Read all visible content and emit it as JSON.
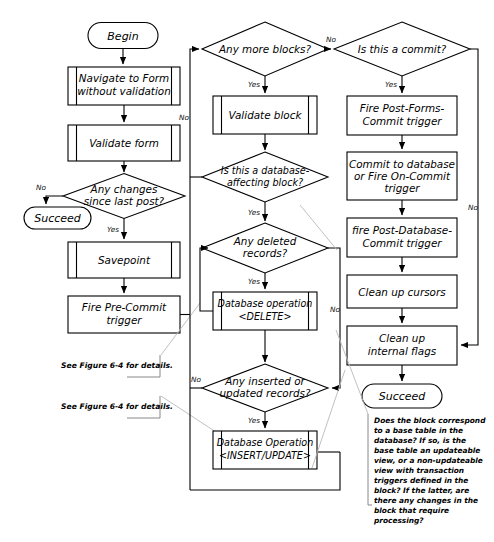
{
  "diagram": {
    "nodes": {
      "begin": "Begin",
      "navigate": [
        "Navigate to Form",
        "without validation"
      ],
      "validate_form": [
        "Validate form"
      ],
      "any_changes": [
        "Any changes",
        "since last post?"
      ],
      "succeed_left": "Succeed",
      "savepoint": [
        "Savepoint"
      ],
      "fire_pre_commit": [
        "Fire Pre-Commit",
        "trigger"
      ],
      "any_more_blocks": [
        "Any more blocks?"
      ],
      "validate_block": [
        "Validate block"
      ],
      "is_db_block": [
        "Is this a database-",
        "affecting block?"
      ],
      "any_deleted": [
        "Any deleted",
        "records?"
      ],
      "db_delete": [
        "Database operation",
        "<DELETE>"
      ],
      "any_inserted": [
        "Any inserted or",
        "updated records?"
      ],
      "db_insert": [
        "Database Operation",
        "<INSERT/UPDATE>"
      ],
      "is_commit": [
        "Is this a commit?"
      ],
      "fire_post_forms": [
        "Fire Post-Forms-",
        "Commit trigger"
      ],
      "commit_db": [
        "Commit to database",
        "or Fire On-Commit",
        "trigger"
      ],
      "fire_post_db": [
        "fire Post-Database-",
        "Commit trigger"
      ],
      "clean_cursors": [
        "Clean up cursors"
      ],
      "clean_flags": [
        "Clean up",
        "internal flags"
      ],
      "succeed_right": "Succeed"
    },
    "edge_labels": {
      "changes_no": "No",
      "changes_yes": "Yes",
      "blocks_no": "No",
      "blocks_yes": "Yes",
      "commit_no": "No",
      "commit_yes": "Yes",
      "dbblock_yes": "Yes",
      "deleted_yes": "Yes",
      "deleted_no": "No",
      "inserted_yes": "Yes",
      "inserted_no": "No"
    },
    "references": [
      "See Figure 6-4 for details.",
      "See Figure 6-4 for details."
    ],
    "note": [
      "Does the block correspond",
      "to a base table in the",
      "database? If so, is the",
      "base table an updateable",
      "view, or a non-updateable",
      "view with transaction",
      "triggers defined in the",
      "block? If the latter, are",
      "there any changes in the",
      "block that require",
      "processing?"
    ],
    "colors": {
      "stroke": "#000000",
      "background": "#ffffff",
      "leader": "#b9b9b9"
    }
  }
}
